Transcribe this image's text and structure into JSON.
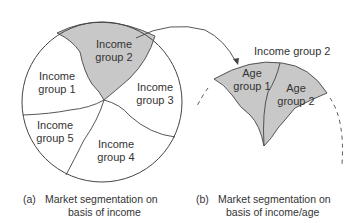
{
  "figure_a": {
    "segments": [
      {
        "id": "income-group-1",
        "line1": "Income",
        "line2": "group 1",
        "highlighted": false
      },
      {
        "id": "income-group-2",
        "line1": "Income",
        "line2": "group 2",
        "highlighted": true
      },
      {
        "id": "income-group-3",
        "line1": "Income",
        "line2": "group 3",
        "highlighted": false
      },
      {
        "id": "income-group-4",
        "line1": "Income",
        "line2": "group 4",
        "highlighted": false
      },
      {
        "id": "income-group-5",
        "line1": "Income",
        "line2": "group 5",
        "highlighted": false
      }
    ],
    "caption_tag": "(a)",
    "caption_line1": "Market segmentation on",
    "caption_line2": "basis of income"
  },
  "figure_b": {
    "title": "Income group 2",
    "segments": [
      {
        "id": "age-group-1",
        "line1": "Age",
        "line2": "group 1"
      },
      {
        "id": "age-group-2",
        "line1": "Age",
        "line2": "group 2"
      }
    ],
    "caption_tag": "(b)",
    "caption_line1": "Market segmentation on",
    "caption_line2": "basis of income/age"
  },
  "colors": {
    "highlight_fill": "#c8c8c8",
    "stroke": "#444444",
    "text": "#333333"
  }
}
